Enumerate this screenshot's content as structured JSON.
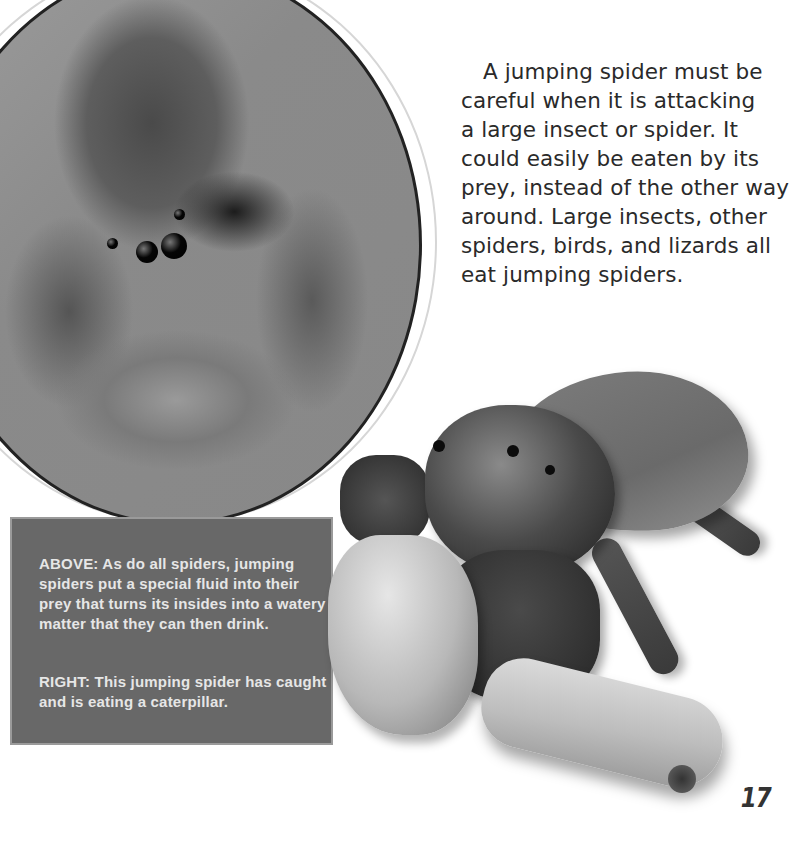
{
  "body_text": {
    "lines": [
      "A jumping spider must be",
      "careful when it is attacking",
      "a large insect or spider. It",
      "could easily be eaten by its",
      "prey, instead of the other way",
      "around. Large insects, other",
      "spiders, birds, and lizards all",
      "eat jumping spiders."
    ]
  },
  "caption": {
    "above": {
      "label": "ABOVE:",
      "text": "As do all spiders, jumping spiders put a special fluid into their prey that turns its insides into a watery matter that they can then drink."
    },
    "right": {
      "label": "RIGHT:",
      "text": "This jumping spider has caught and is eating a caterpillar."
    }
  },
  "images": {
    "circle_photo": "jumping spider eating an insect (circular photo)",
    "cutout_photo": "jumping spider eating a caterpillar (cutout photo)"
  },
  "page_number": "17",
  "colors": {
    "caption_bg": "#686868",
    "caption_text": "#e6e6e6",
    "body_text": "#2a2a2a",
    "page_bg": "#ffffff"
  }
}
